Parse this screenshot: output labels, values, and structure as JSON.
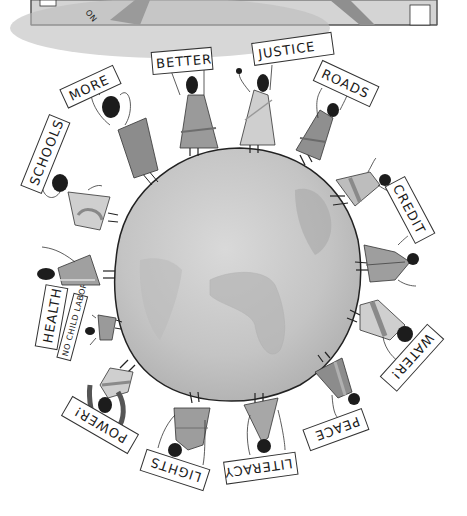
{
  "illustration": {
    "description": "Globe surrounded by people holding protest signs",
    "top_panel": {
      "visible_sign_fragment": "ON"
    },
    "globe": {
      "fill_color": "#c8c8c8",
      "outline_color": "#222222"
    },
    "colors": {
      "background": "#ffffff",
      "ink": "#1a1a1a",
      "dress_dark": "#8a8a8a",
      "dress_mid": "#a8a8a8",
      "dress_light": "#cfcfcf",
      "head": "#1c1c1c"
    },
    "signs": [
      {
        "id": "more",
        "text": "MORE"
      },
      {
        "id": "better",
        "text": "BETTER"
      },
      {
        "id": "justice",
        "text": "JUSTICE"
      },
      {
        "id": "roads",
        "text": "ROADS"
      },
      {
        "id": "credit",
        "text": "CREDIT"
      },
      {
        "id": "water",
        "text": "WATER!"
      },
      {
        "id": "peace",
        "text": "PEACE"
      },
      {
        "id": "literacy",
        "text": "LITERACY"
      },
      {
        "id": "lights",
        "text": "LIGHTS"
      },
      {
        "id": "power",
        "text": "POWER!"
      },
      {
        "id": "no-child-labor",
        "text": "NO CHILD LABOR"
      },
      {
        "id": "health",
        "text": "HEALTH"
      },
      {
        "id": "schools",
        "text": "SCHOOLS"
      }
    ]
  }
}
